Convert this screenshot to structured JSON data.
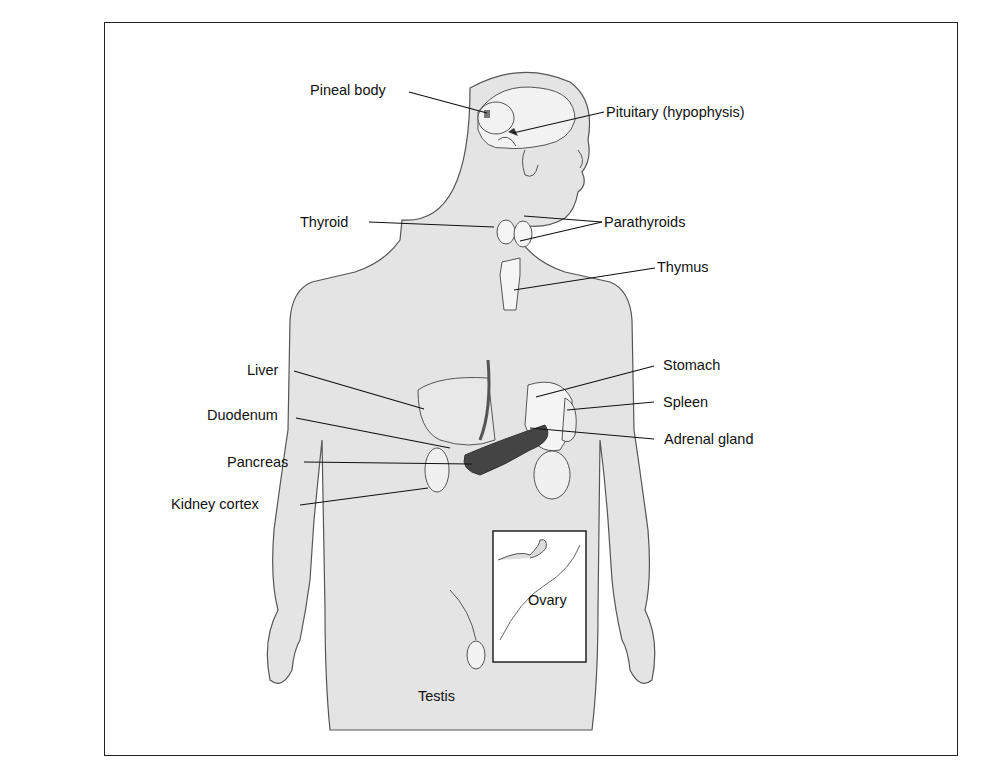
{
  "figure": {
    "colors": {
      "body_fill": "#e4e4e4",
      "outline": "#444444",
      "frame": "#222222",
      "label": "#111111",
      "organ_dark": "#555555"
    }
  },
  "labels": {
    "pineal": "Pineal body",
    "pituitary": "Pituitary (hypophysis)",
    "thyroid": "Thyroid",
    "parathyroids": "Parathyroids",
    "thymus": "Thymus",
    "liver": "Liver",
    "stomach": "Stomach",
    "spleen": "Spleen",
    "duodenum": "Duodenum",
    "adrenal": "Adrenal gland",
    "pancreas": "Pancreas",
    "kidney": "Kidney cortex",
    "ovary": "Ovary",
    "testis": "Testis"
  }
}
